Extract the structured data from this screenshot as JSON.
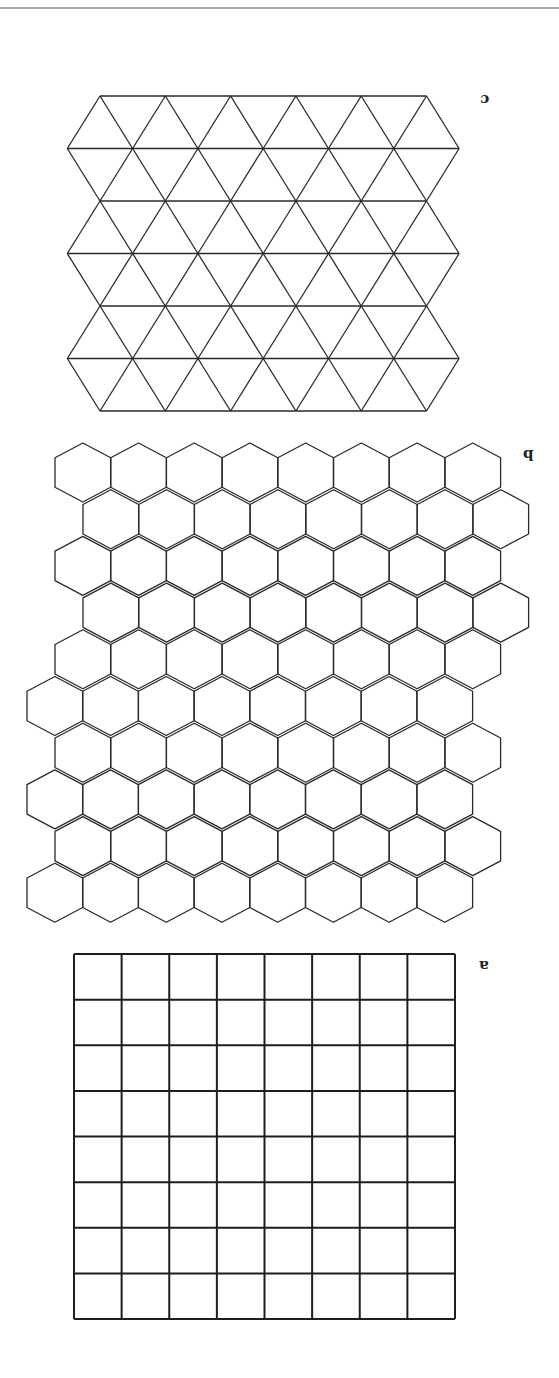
{
  "figure": {
    "orientation": "rotated 180 degrees",
    "top_rule": {
      "y": 8,
      "color": "#555555"
    },
    "line_color": "#2a2a2a",
    "panels": [
      {
        "id": "c",
        "label": "c",
        "label_position": {
          "x": 480,
          "y": 92
        },
        "type": "triangle-tiling",
        "rows": 6,
        "triangles_per_row_up": 6,
        "horizontal_lines_y": [
          96,
          148.5,
          201,
          253.5,
          306,
          358.5,
          411
        ],
        "edge_length": 65.3,
        "top_left_x": 100,
        "row_left_shift": 32.7
      },
      {
        "id": "b",
        "label": "b",
        "label_position": {
          "x": 523,
          "y": 447
        },
        "type": "hexagon-tiling",
        "rows": 10,
        "hexes_per_row": 8,
        "hex_width": 55.7,
        "hex_height": 59,
        "row_step": 46.7,
        "top_y": 443,
        "row_left_x": [
          55,
          83,
          55,
          83,
          55,
          27,
          55,
          27,
          55,
          27
        ]
      },
      {
        "id": "a",
        "label": "a",
        "label_position": {
          "x": 479,
          "y": 958
        },
        "type": "square-grid",
        "columns": 8,
        "rows": 8,
        "left": 74,
        "top": 954,
        "right": 455,
        "bottom": 1319
      }
    ]
  }
}
